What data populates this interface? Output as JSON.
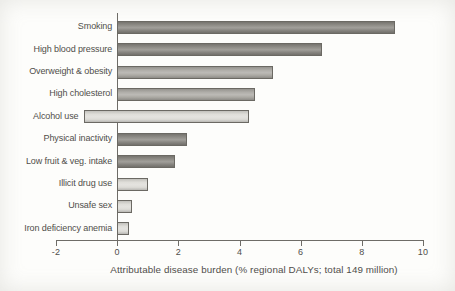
{
  "chart_data": {
    "type": "bar",
    "orientation": "horizontal",
    "title": "",
    "xlabel": "Attributable disease burden (% regional DALYs; total 149 million)",
    "ylabel": "",
    "xlim": [
      -2,
      10
    ],
    "xticks": [
      -2,
      0,
      2,
      4,
      6,
      8,
      10
    ],
    "grid": false,
    "legend": "none",
    "categories": [
      "Smoking",
      "High blood pressure",
      "Overweight & obesity",
      "High cholesterol",
      "Alcohol use",
      "Physical inactivity",
      "Low fruit & veg. intake",
      "Illicit drug use",
      "Unsafe sex",
      "Iron deficiency anemia"
    ],
    "bars": [
      {
        "label": "Smoking",
        "start": 0,
        "value": 9.1,
        "shade": "dark"
      },
      {
        "label": "High blood pressure",
        "start": 0,
        "value": 6.7,
        "shade": "dark"
      },
      {
        "label": "Overweight & obesity",
        "start": 0,
        "value": 5.1,
        "shade": "medium"
      },
      {
        "label": "High cholesterol",
        "start": 0,
        "value": 4.5,
        "shade": "medium"
      },
      {
        "label": "Alcohol use",
        "start": -1.1,
        "value": 4.3,
        "shade": "light"
      },
      {
        "label": "Physical inactivity",
        "start": 0,
        "value": 2.3,
        "shade": "dark"
      },
      {
        "label": "Low fruit & veg. intake",
        "start": 0,
        "value": 1.9,
        "shade": "dark"
      },
      {
        "label": "Illicit drug use",
        "start": 0,
        "value": 1.0,
        "shade": "light"
      },
      {
        "label": "Unsafe sex",
        "start": 0,
        "value": 0.5,
        "shade": "light"
      },
      {
        "label": "Iron deficiency anemia",
        "start": 0,
        "value": 0.4,
        "shade": "light"
      }
    ],
    "colors": {
      "dark": "#86847e",
      "medium": "#a9a7a1",
      "light": "#dcdbd6",
      "bar_border": "#6b6963",
      "axis": "#6e6c67",
      "text": "#504e4a",
      "background": "#fdfdfb"
    }
  }
}
